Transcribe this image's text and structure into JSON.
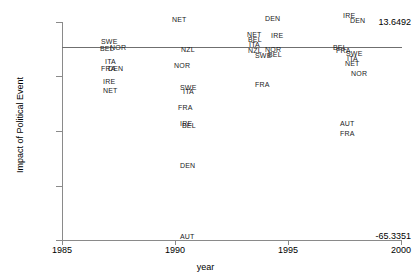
{
  "chart_data": {
    "type": "scatter",
    "title": "",
    "xlabel": "year",
    "ylabel": "Impact of Political Event",
    "xlim": [
      1985,
      2000
    ],
    "ylim": [
      -65.3351,
      13.6492
    ],
    "xticks": [
      "1985",
      "1990",
      "1995",
      "2000"
    ],
    "yticks": [
      "13.6492",
      "-65.3351"
    ],
    "grid": false,
    "legend": null,
    "reference_line": {
      "y": 0,
      "orientation": "horizontal"
    },
    "marker_style": "text-label",
    "points": [
      {
        "label": "SWE",
        "x": 1986.6,
        "y": 3.2,
        "px": 101,
        "py": 38
      },
      {
        "label": "BEL",
        "x": 1986.5,
        "y": 0.9,
        "px": 100,
        "py": 45
      },
      {
        "label": "NOR",
        "x": 1987.1,
        "y": 0.8,
        "px": 110,
        "py": 44
      },
      {
        "label": "ITA",
        "x": 1986.8,
        "y": -3.9,
        "px": 105,
        "py": 58
      },
      {
        "label": "FRA",
        "x": 1986.6,
        "y": -6.2,
        "px": 101,
        "py": 65
      },
      {
        "label": "DEN",
        "x": 1987.0,
        "y": -6.2,
        "px": 108,
        "py": 65
      },
      {
        "label": "IRE",
        "x": 1986.7,
        "y": -10.6,
        "px": 103,
        "py": 78
      },
      {
        "label": "NET",
        "x": 1986.7,
        "y": -13.5,
        "px": 103,
        "py": 87
      },
      {
        "label": "NET",
        "x": 1989.5,
        "y": 11.0,
        "px": 172,
        "py": 16
      },
      {
        "label": "NZL",
        "x": 1989.9,
        "y": 0.4,
        "px": 181,
        "py": 46
      },
      {
        "label": "NOR",
        "x": 1989.6,
        "y": -5.0,
        "px": 174,
        "py": 62
      },
      {
        "label": "SWE",
        "x": 1989.9,
        "y": -12.3,
        "px": 180,
        "py": 84
      },
      {
        "label": "ITA",
        "x": 1990.0,
        "y": -13.8,
        "px": 183,
        "py": 88
      },
      {
        "label": "FRA",
        "x": 1989.8,
        "y": -19.0,
        "px": 178,
        "py": 104
      },
      {
        "label": "IRE",
        "x": 1989.9,
        "y": -24.4,
        "px": 180,
        "py": 120
      },
      {
        "label": "BEL",
        "x": 1990.0,
        "y": -24.9,
        "px": 182,
        "py": 122
      },
      {
        "label": "DEN",
        "x": 1989.9,
        "y": -38.3,
        "px": 180,
        "py": 162
      },
      {
        "label": "AUT",
        "x": 1989.9,
        "y": -57.8,
        "px": 180,
        "py": 233
      },
      {
        "label": "DEN",
        "x": 1993.9,
        "y": 11.5,
        "px": 265,
        "py": 15
      },
      {
        "label": "NET",
        "x": 1993.6,
        "y": 4.6,
        "px": 247,
        "py": 31
      },
      {
        "label": "IRE",
        "x": 1994.3,
        "y": 4.4,
        "px": 271,
        "py": 32
      },
      {
        "label": "BEL",
        "x": 1993.7,
        "y": 3.2,
        "px": 248,
        "py": 36
      },
      {
        "label": "ITA",
        "x": 1993.7,
        "y": 2.0,
        "px": 249,
        "py": 41
      },
      {
        "label": "NZL",
        "x": 1993.7,
        "y": 0.6,
        "px": 248,
        "py": 47
      },
      {
        "label": "NOR",
        "x": 1994.2,
        "y": 0.6,
        "px": 265,
        "py": 46
      },
      {
        "label": "SWE",
        "x": 1993.9,
        "y": -0.6,
        "px": 255,
        "py": 52
      },
      {
        "label": "BEL",
        "x": 1994.3,
        "y": -0.6,
        "px": 268,
        "py": 51
      },
      {
        "label": "FRA",
        "x": 1993.9,
        "y": -7.8,
        "px": 255,
        "py": 81
      },
      {
        "label": "IRE",
        "x": 1997.6,
        "y": 12.1,
        "px": 343,
        "py": 12
      },
      {
        "label": "DEN",
        "x": 1997.9,
        "y": 11.1,
        "px": 350,
        "py": 17
      },
      {
        "label": "BEL",
        "x": 1997.2,
        "y": 1.0,
        "px": 333,
        "py": 44
      },
      {
        "label": "FRA",
        "x": 1997.3,
        "y": 0.5,
        "px": 336,
        "py": 47
      },
      {
        "label": "SWE",
        "x": 1997.7,
        "y": -0.5,
        "px": 346,
        "py": 50
      },
      {
        "label": "ITA",
        "x": 1997.7,
        "y": -1.6,
        "px": 347,
        "py": 55
      },
      {
        "label": "NET",
        "x": 1997.7,
        "y": -3.0,
        "px": 345,
        "py": 60
      },
      {
        "label": "NOR",
        "x": 1997.9,
        "y": -6.2,
        "px": 351,
        "py": 70
      },
      {
        "label": "AUT",
        "x": 1997.6,
        "y": -22.0,
        "px": 340,
        "py": 120
      },
      {
        "label": "FRA",
        "x": 1997.6,
        "y": -24.4,
        "px": 340,
        "py": 130
      }
    ]
  },
  "axis": {
    "y_top_label": "13.6492",
    "y_bottom_label": "-65.3351",
    "y_title": "Impact of Political Event",
    "x_title": "year",
    "x_tick_labels": [
      "1985",
      "1990",
      "1995",
      "2000"
    ]
  }
}
